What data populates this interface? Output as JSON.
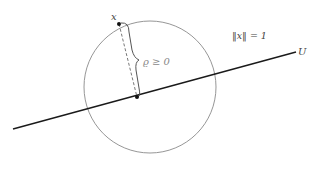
{
  "diagram": {
    "labels": {
      "point": "x",
      "norm": "‖x‖ = 1",
      "distance": "ϱ ≥ 0",
      "subspace": "U"
    },
    "colors": {
      "line": "#1a1a1a",
      "circle": "#8a8a8a",
      "brace": "#555555",
      "dashed": "#555555",
      "point": "#111111",
      "label": "#444444",
      "distance_label": "#888888"
    },
    "geometry": {
      "circle": {
        "cx": 150,
        "cy": 87,
        "r": 66
      },
      "line": {
        "x1": 13,
        "y1": 129,
        "x2": 296,
        "y2": 52
      },
      "point_x": {
        "cx": 119,
        "cy": 24
      },
      "projection": {
        "cx": 137,
        "cy": 97
      }
    }
  }
}
